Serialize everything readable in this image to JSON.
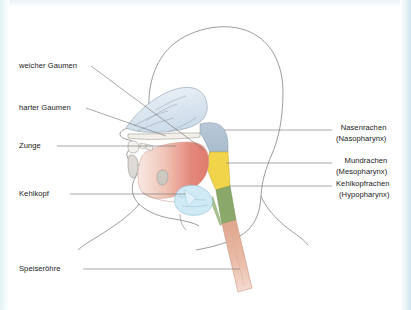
{
  "figure": {
    "type": "anatomical-diagram",
    "language": "de"
  },
  "labels_left": [
    {
      "id": "weicher-gaumen",
      "text": "weicher Gaumen"
    },
    {
      "id": "harter-gaumen",
      "text": "harter Gaumen"
    },
    {
      "id": "zunge",
      "text": "Zunge"
    },
    {
      "id": "kehlkopf",
      "text": "Kehlkopf"
    },
    {
      "id": "speiseroehre",
      "text": "Speiseröhre"
    }
  ],
  "labels_right": [
    {
      "id": "nasenrachen",
      "title": "Nasenrachen",
      "latin": "(Nasopharynx)"
    },
    {
      "id": "mundrachen",
      "title": "Mundrachen",
      "latin": "(Mesopharynx)"
    },
    {
      "id": "kehlkopfrachen",
      "title": "Kehlkopfrachen",
      "latin": "(Hypopharynx)"
    }
  ],
  "regions": [
    {
      "id": "nasopharynx",
      "color": "#aebfd0"
    },
    {
      "id": "mesopharynx",
      "color": "#f2d44a"
    },
    {
      "id": "hypopharynx",
      "color": "#8aa86a"
    },
    {
      "id": "esophagus",
      "color": "#e8b9a4"
    },
    {
      "id": "larynx",
      "color": "#bfe2f2"
    },
    {
      "id": "tongue",
      "color": "#e8938a"
    },
    {
      "id": "nasal-cavity",
      "color": "#d8e4ee"
    }
  ],
  "colors": {
    "outline": "#8a8a8a",
    "leader": "#7a7a7a",
    "text": "#1a1a1a",
    "page_margin": "#e3f2f7"
  }
}
